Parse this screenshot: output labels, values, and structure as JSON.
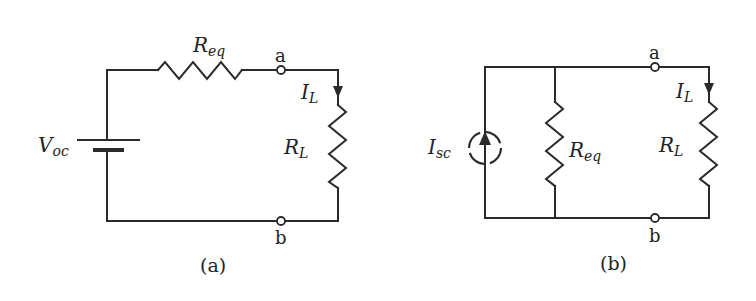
{
  "figure": {
    "background": "#ffffff",
    "line_color": "#2a2a2a",
    "circuits": [
      {
        "id": "a",
        "caption": "(a)",
        "labels": {
          "source_main": "V",
          "source_sub": "oc",
          "series_resistor_main": "R",
          "series_resistor_sub": "eq",
          "load_resistor_main": "R",
          "load_resistor_sub": "L",
          "current_main": "I",
          "current_sub": "L",
          "node_top": "a",
          "node_bottom": "b"
        },
        "components": [
          "voltage source V_oc",
          "series resistor R_eq",
          "load resistor R_L",
          "terminal a",
          "terminal b"
        ]
      },
      {
        "id": "b",
        "caption": "(b)",
        "labels": {
          "source_main": "I",
          "source_sub": "sc",
          "shunt_resistor_main": "R",
          "shunt_resistor_sub": "eq",
          "load_resistor_main": "R",
          "load_resistor_sub": "L",
          "current_main": "I",
          "current_sub": "L",
          "node_top": "a",
          "node_bottom": "b"
        },
        "components": [
          "current source I_sc",
          "parallel resistor R_eq",
          "load resistor R_L",
          "terminal a",
          "terminal b"
        ]
      }
    ]
  }
}
